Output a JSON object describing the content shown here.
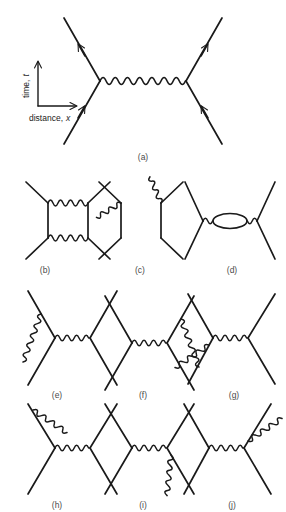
{
  "figure": {
    "title_visible": false,
    "background_color": "#ffffff",
    "line_color": "#1a1a1a",
    "caption_color": "#4a4a4a",
    "axes": {
      "y_label_text": "time, t",
      "y_label_plain": "time,",
      "y_label_italic": "t",
      "x_label_plain": "distance,",
      "x_label_italic": "x",
      "x_label_text": "distance, x"
    },
    "panels": [
      {
        "id": "a",
        "caption": "(a)",
        "description": "tree-level electron scattering with single photon exchange",
        "row": 1
      },
      {
        "id": "b",
        "caption": "(b)",
        "description": "box diagram, two horizontal photon exchanges",
        "row": 2
      },
      {
        "id": "c",
        "caption": "(c)",
        "description": "crossed box diagram, two crossed photon exchanges",
        "row": 2
      },
      {
        "id": "d",
        "caption": "(d)",
        "description": "vacuum polarization, photon self-energy loop",
        "row": 2
      },
      {
        "id": "e",
        "caption": "(e)",
        "description": "vertex correction on left vertex",
        "row": 3
      },
      {
        "id": "f",
        "caption": "(f)",
        "description": "vertex correction on right vertex",
        "row": 3
      },
      {
        "id": "g",
        "caption": "(g)",
        "description": "self-energy on lower-left incoming line",
        "row": 3
      },
      {
        "id": "h",
        "caption": "(h)",
        "description": "self-energy on upper-left outgoing line",
        "row": 4
      },
      {
        "id": "i",
        "caption": "(i)",
        "description": "self-energy on lower-right incoming line",
        "row": 4
      },
      {
        "id": "j",
        "caption": "(j)",
        "description": "self-energy on upper-right outgoing line",
        "row": 4
      }
    ]
  }
}
